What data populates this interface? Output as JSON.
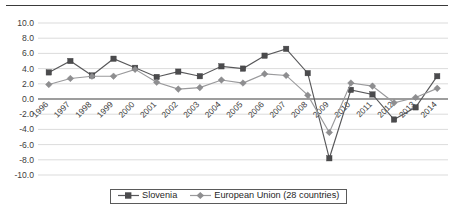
{
  "chart_data": {
    "type": "line",
    "title": "",
    "xlabel": "",
    "ylabel": "",
    "ylim": [
      -10.0,
      10.0
    ],
    "ytick_step": 2.0,
    "grid": true,
    "legend_position": "bottom",
    "categories": [
      "1996",
      "1997",
      "1998",
      "1999",
      "2000",
      "2001",
      "2002",
      "2003",
      "2004",
      "2005",
      "2006",
      "2007",
      "2008",
      "2009",
      "2010",
      "2011",
      "2012",
      "2013",
      "2014"
    ],
    "yticks": [
      "10.0",
      "8.0",
      "6.0",
      "4.0",
      "2.0",
      "0.0",
      "-2.0",
      "-4.0",
      "-6.0",
      "-8.0",
      "-10.0"
    ],
    "series": [
      {
        "name": "Slovenia",
        "color": "#58585a",
        "marker": "square",
        "values": [
          3.5,
          5.0,
          3.1,
          5.3,
          4.1,
          2.9,
          3.6,
          3.0,
          4.3,
          4.0,
          5.7,
          6.6,
          3.4,
          -7.8,
          1.2,
          0.6,
          -2.7,
          -1.1,
          3.0
        ]
      },
      {
        "name": "European Union (28 countries)",
        "color": "#9a9a9c",
        "marker": "diamond",
        "values": [
          1.9,
          2.7,
          3.0,
          3.0,
          3.9,
          2.2,
          1.3,
          1.5,
          2.5,
          2.1,
          3.3,
          3.1,
          0.5,
          -4.4,
          2.1,
          1.7,
          -0.5,
          0.2,
          1.4
        ]
      }
    ]
  },
  "legend": {
    "items": [
      {
        "label": "Slovenia",
        "marker": "square",
        "color": "#4b4b4d"
      },
      {
        "label": "European Union (28 countries)",
        "marker": "diamond",
        "color": "#8e8e90"
      }
    ]
  }
}
